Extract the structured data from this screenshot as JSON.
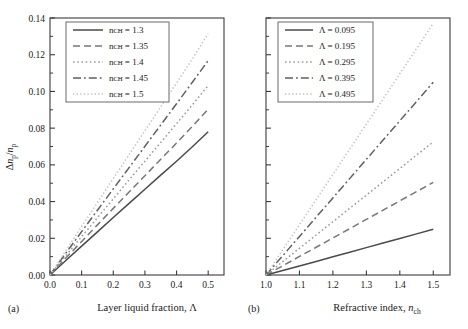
{
  "figure": {
    "panels": [
      {
        "tag": "(a)",
        "xlabel": "Layer liquid fraction, Λ",
        "ylabel": "Δnₚ/nₚ"
      },
      {
        "tag": "(b)",
        "xlabel": "Refractive index, nᴄʜ",
        "ylabel": ""
      }
    ]
  },
  "chart_data": [
    {
      "type": "line",
      "panel": "(a)",
      "title": "",
      "xlabel": "Layer liquid fraction, Λ",
      "ylabel": "Δn_p/n_p",
      "xlim": [
        0.0,
        0.55
      ],
      "ylim": [
        0.0,
        0.14
      ],
      "xticks": [
        0.0,
        0.1,
        0.2,
        0.3,
        0.4,
        0.5
      ],
      "xticklabels": [
        "0.0",
        "0.1",
        "0.2",
        "0.3",
        "0.4",
        "0.5"
      ],
      "yticks": [
        0.0,
        0.02,
        0.04,
        0.06,
        0.08,
        0.1,
        0.12,
        0.14
      ],
      "yticklabels": [
        "0.00",
        "0.02",
        "0.04",
        "0.06",
        "0.08",
        "0.10",
        "0.12",
        "0.14"
      ],
      "minor_yticks": [
        0.01,
        0.03,
        0.05,
        0.07,
        0.09,
        0.11,
        0.13
      ],
      "grid": false,
      "legend_position": "upper-left",
      "legend_title": "",
      "x": [
        0.0,
        0.05,
        0.1,
        0.15,
        0.2,
        0.25,
        0.3,
        0.35,
        0.4,
        0.45,
        0.5
      ],
      "series": [
        {
          "name": "n_ch = 1.3",
          "label": "nᴄʜ = 1.3",
          "style": "solid",
          "color": "#4a4a4a",
          "values": [
            0.0,
            0.0079,
            0.0157,
            0.0235,
            0.0313,
            0.039,
            0.0467,
            0.0544,
            0.062,
            0.0699,
            0.078
          ]
        },
        {
          "name": "n_ch = 1.35",
          "label": "nᴄʜ = 1.35",
          "style": "dashed",
          "color": "#777777",
          "values": [
            0.0,
            0.0092,
            0.0183,
            0.0273,
            0.0363,
            0.0452,
            0.0541,
            0.063,
            0.0719,
            0.081,
            0.0903
          ]
        },
        {
          "name": "n_ch = 1.4",
          "label": "nᴄʜ = 1.4",
          "style": "dotted",
          "color": "#9a9a9a",
          "values": [
            0.0,
            0.0105,
            0.0209,
            0.0312,
            0.0415,
            0.0518,
            0.062,
            0.0722,
            0.0824,
            0.0927,
            0.1032
          ]
        },
        {
          "name": "n_ch = 1.45",
          "label": "nᴄʜ = 1.45",
          "style": "dashdot",
          "color": "#5f5f5f",
          "values": [
            0.0,
            0.0119,
            0.0236,
            0.0353,
            0.0469,
            0.0585,
            0.0701,
            0.0817,
            0.0933,
            0.105,
            0.1168
          ]
        },
        {
          "name": "n_ch = 1.5",
          "label": "nᴄʜ = 1.5",
          "style": "densely-dotted",
          "color": "#c2c2c2",
          "values": [
            0.0,
            0.0133,
            0.0264,
            0.0395,
            0.0525,
            0.0655,
            0.0785,
            0.0915,
            0.1045,
            0.1178,
            0.1315
          ]
        }
      ]
    },
    {
      "type": "line",
      "panel": "(b)",
      "title": "",
      "xlabel": "Refractive index, n_ch",
      "ylabel": "Δn_p/n_p",
      "xlim": [
        1.0,
        1.55
      ],
      "ylim": [
        0.0,
        0.14
      ],
      "xticks": [
        1.0,
        1.1,
        1.2,
        1.3,
        1.4,
        1.5
      ],
      "xticklabels": [
        "1.0",
        "1.1",
        "1.2",
        "1.3",
        "1.4",
        "1.5"
      ],
      "yticks": [
        0.0,
        0.02,
        0.04,
        0.06,
        0.08,
        0.1,
        0.12,
        0.14
      ],
      "yticklabels": [],
      "minor_yticks": [
        0.01,
        0.03,
        0.05,
        0.07,
        0.09,
        0.11,
        0.13
      ],
      "grid": false,
      "legend_position": "upper-left",
      "legend_title": "",
      "x": [
        1.0,
        1.05,
        1.1,
        1.15,
        1.2,
        1.25,
        1.3,
        1.35,
        1.4,
        1.45,
        1.5
      ],
      "series": [
        {
          "name": "Lambda = 0.095",
          "label": "Λ = 0.095",
          "style": "solid",
          "color": "#4a4a4a",
          "values": [
            0.0,
            0.0024,
            0.0049,
            0.0074,
            0.0099,
            0.0124,
            0.0149,
            0.0174,
            0.0199,
            0.0224,
            0.0249
          ]
        },
        {
          "name": "Lambda = 0.195",
          "label": "Λ = 0.195",
          "style": "dashed",
          "color": "#777777",
          "values": [
            0.0,
            0.005,
            0.0101,
            0.0151,
            0.0202,
            0.0252,
            0.0303,
            0.0353,
            0.0404,
            0.0454,
            0.0505
          ]
        },
        {
          "name": "Lambda = 0.295",
          "label": "Λ = 0.295",
          "style": "dotted",
          "color": "#9a9a9a",
          "values": [
            0.0,
            0.0073,
            0.0145,
            0.0218,
            0.029,
            0.0363,
            0.0435,
            0.0508,
            0.058,
            0.0653,
            0.0725
          ]
        },
        {
          "name": "Lambda = 0.395",
          "label": "Λ = 0.395",
          "style": "dashdot",
          "color": "#5f5f5f",
          "values": [
            0.0,
            0.0105,
            0.021,
            0.0315,
            0.042,
            0.0525,
            0.063,
            0.0735,
            0.084,
            0.0945,
            0.105
          ]
        },
        {
          "name": "Lambda = 0.495",
          "label": "Λ = 0.495",
          "style": "densely-dotted",
          "color": "#c2c2c2",
          "values": [
            0.0,
            0.0137,
            0.0274,
            0.0411,
            0.0548,
            0.0685,
            0.0822,
            0.0959,
            0.1096,
            0.1233,
            0.137
          ]
        }
      ]
    }
  ]
}
